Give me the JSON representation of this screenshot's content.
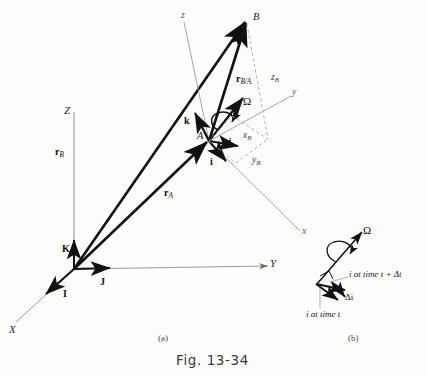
{
  "figure": {
    "caption": "Fig. 13-34",
    "panel_a_label": "(a)",
    "panel_b_label": "(b)",
    "background_color": "#fdfdfc",
    "ink_color": "#111111",
    "axis_color": "#8a8a8a",
    "dashed_color": "#a8a8a8"
  },
  "panel_a": {
    "fixed_frame": {
      "axes": [
        {
          "name": "Z",
          "label": "Z"
        },
        {
          "name": "Y",
          "label": "Y"
        },
        {
          "name": "X",
          "label": "X"
        }
      ],
      "unit_vectors": [
        {
          "name": "K",
          "label": "K"
        },
        {
          "name": "J",
          "label": "J"
        },
        {
          "name": "I",
          "label": "I"
        }
      ]
    },
    "moving_frame": {
      "axes": [
        {
          "name": "z",
          "label": "z"
        },
        {
          "name": "y",
          "label": "y"
        },
        {
          "name": "x",
          "label": "x"
        }
      ],
      "unit_vectors": [
        {
          "name": "k",
          "label": "k"
        },
        {
          "name": "j",
          "label": "j"
        },
        {
          "name": "i",
          "label": "i"
        }
      ]
    },
    "points": [
      {
        "name": "A",
        "label": "A"
      },
      {
        "name": "B",
        "label": "B"
      }
    ],
    "vectors": [
      {
        "name": "r_B",
        "label": "r",
        "subscript": "B"
      },
      {
        "name": "r_A",
        "label": "r",
        "subscript": "A"
      },
      {
        "name": "r_B/A",
        "label": "r",
        "subscript": "B/A"
      }
    ],
    "angular_velocity": {
      "label": "Ω"
    },
    "projections": [
      {
        "name": "x_B",
        "label": "x",
        "subscript": "B"
      },
      {
        "name": "y_B",
        "label": "y",
        "subscript": "B"
      },
      {
        "name": "z_B",
        "label": "z",
        "subscript": "B"
      }
    ]
  },
  "panel_b": {
    "angular_velocity": {
      "label": "Ω"
    },
    "annotations": [
      {
        "name": "i-at-time-t-plus-dt",
        "label": "i at time t + Δt"
      },
      {
        "name": "delta-i",
        "label": "Δi"
      },
      {
        "name": "i-at-time-t",
        "label": "i at time t"
      }
    ]
  }
}
